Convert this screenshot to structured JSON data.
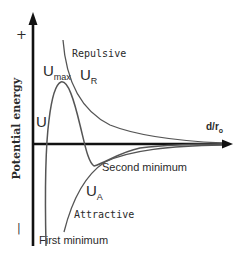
{
  "diagram": {
    "y_axis": {
      "label": "Potential energy",
      "plus": "+",
      "minus": "|"
    },
    "x_axis": {
      "label_main": "d/r",
      "label_sub": "o"
    },
    "curves": {
      "total": {
        "label": "U"
      },
      "repulsive": {
        "label_main": "U",
        "label_sub": "R",
        "name": "Repulsive"
      },
      "attractive": {
        "label_main": "U",
        "label_sub": "A",
        "name": "Attractive"
      }
    },
    "annotations": {
      "max": {
        "label_main": "U",
        "label_sub": "max"
      },
      "second_minimum": "Second minimum",
      "first_minimum": "First minimum"
    },
    "colors": {
      "axis": "#111111",
      "curve": "#555555",
      "text": "#2a2a2a"
    }
  }
}
